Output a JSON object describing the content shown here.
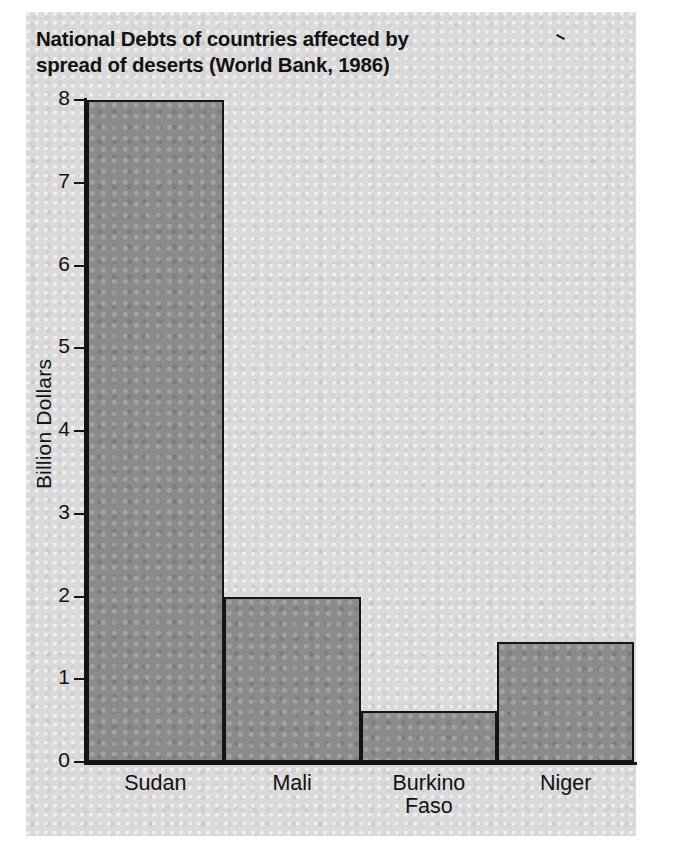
{
  "chart_data": {
    "type": "bar",
    "title": "National Debts of countries affected by\nspread of deserts (World Bank, 1986)",
    "xlabel": "",
    "ylabel": "Billion Dollars",
    "categories": [
      "Sudan",
      "Mali",
      "Burkino\nFaso",
      "Niger"
    ],
    "values": [
      8.0,
      2.0,
      0.62,
      1.45
    ],
    "unit": "Billion Dollars",
    "ylim": [
      0,
      8
    ],
    "yticks": [
      0,
      1,
      2,
      3,
      4,
      5,
      6,
      7,
      8
    ],
    "ytick_labels": [
      "0",
      "1",
      "2",
      "3",
      "4",
      "5",
      "6",
      "7",
      "8"
    ],
    "grid": false,
    "legend": null,
    "bar_fill_color": "#8b8b8b",
    "bar_edge_color": "#151515",
    "background_color": "#dadada",
    "source": "World Bank, 1986"
  },
  "figure": {
    "title_line_1": "National Debts of countries affected by",
    "title_line_2": "spread of deserts (World Bank, 1986)"
  }
}
